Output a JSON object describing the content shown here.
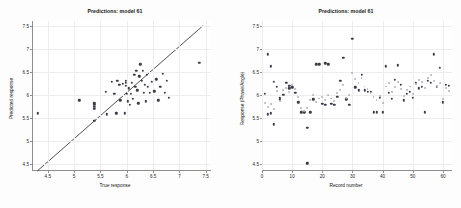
{
  "figure": {
    "background_color": "#fdfdfd",
    "plot_background_color": "#ffffff",
    "grid_color": "#ededed",
    "axis_color": "#8e8e8e",
    "marker_dark_color": "#3c3c46",
    "marker_light_color": "#b2b2bb",
    "identity_line_color": "#3c3c46"
  },
  "panels": {
    "left": {
      "title": "Predictions: model 61",
      "xlabel": "True response",
      "ylabel": "Predicted response",
      "xticks": [
        "4.5",
        "5",
        "5.5",
        "6",
        "6.5",
        "7",
        "7.5"
      ],
      "yticks": [
        "7.5",
        "7",
        "6.5",
        "6",
        "5.5",
        "5",
        "4.5"
      ]
    },
    "right": {
      "title": "Predictions: model 61",
      "xlabel": "Record number",
      "ylabel": "Response (Phase/Angle)",
      "xticks": [
        "0",
        "10",
        "20",
        "30",
        "40",
        "50",
        "60"
      ],
      "yticks": [
        "7.5",
        "7",
        "6.5",
        "6",
        "5.5",
        "5",
        "4.5"
      ]
    }
  },
  "chart_data": [
    {
      "type": "scatter",
      "title": "Predictions: model 61",
      "xlabel": "True response",
      "ylabel": "Predicted response",
      "xlim": [
        4.2,
        7.6
      ],
      "ylim": [
        4.35,
        7.6
      ],
      "grid": true,
      "legend": null,
      "annotations": [
        "identity line y = x drawn from (4.3,4.35) to (7.45,7.5)"
      ],
      "reference_line": {
        "type": "identity",
        "from": [
          4.3,
          4.35
        ],
        "to": [
          7.45,
          7.5
        ]
      },
      "series": [
        {
          "name": "predicted vs true",
          "marker": "dot",
          "color": "#3c3c46",
          "points": [
            [
              4.31,
              5.6
            ],
            [
              5.1,
              5.88
            ],
            [
              5.38,
              5.44
            ],
            [
              5.38,
              5.7
            ],
            [
              5.38,
              5.74
            ],
            [
              5.38,
              5.78
            ],
            [
              5.38,
              5.82
            ],
            [
              5.6,
              6.06
            ],
            [
              5.62,
              5.58
            ],
            [
              5.72,
              6.28
            ],
            [
              5.76,
              6.02
            ],
            [
              5.8,
              5.6
            ],
            [
              5.82,
              6.3
            ],
            [
              5.86,
              6.22
            ],
            [
              5.88,
              5.88
            ],
            [
              5.92,
              6.24
            ],
            [
              5.96,
              5.6
            ],
            [
              5.98,
              6.2
            ],
            [
              5.98,
              6.26
            ],
            [
              5.98,
              6.3
            ],
            [
              6.0,
              6.02
            ],
            [
              6.02,
              5.86
            ],
            [
              6.04,
              6.14
            ],
            [
              6.06,
              5.78
            ],
            [
              6.08,
              6.02
            ],
            [
              6.1,
              6.26
            ],
            [
              6.12,
              5.92
            ],
            [
              6.14,
              6.44
            ],
            [
              6.16,
              6.18
            ],
            [
              6.18,
              6.52
            ],
            [
              6.2,
              6.1
            ],
            [
              6.22,
              5.82
            ],
            [
              6.24,
              6.4
            ],
            [
              6.26,
              6.66
            ],
            [
              6.28,
              6.3
            ],
            [
              6.3,
              6.52
            ],
            [
              6.32,
              6.04
            ],
            [
              6.34,
              6.22
            ],
            [
              6.36,
              5.86
            ],
            [
              6.38,
              6.44
            ],
            [
              6.4,
              6.18
            ],
            [
              6.44,
              6.04
            ],
            [
              6.48,
              6.28
            ],
            [
              6.52,
              6.08
            ],
            [
              6.56,
              6.34
            ],
            [
              6.6,
              5.88
            ],
            [
              6.64,
              6.18
            ],
            [
              6.68,
              6.46
            ],
            [
              6.72,
              6.04
            ],
            [
              6.76,
              6.3
            ],
            [
              6.8,
              5.94
            ],
            [
              7.38,
              6.7
            ]
          ]
        }
      ]
    },
    {
      "type": "scatter",
      "title": "Predictions: model 61",
      "xlabel": "Record number",
      "ylabel": "Response (Phase/Angle)",
      "xlim": [
        0,
        63
      ],
      "ylim": [
        4.35,
        7.6
      ],
      "grid": true,
      "legend": null,
      "series": [
        {
          "name": "observed",
          "marker": "dot",
          "color": "#3c3c46",
          "points": [
            [
              1,
              6.02
            ],
            [
              2,
              5.58
            ],
            [
              2,
              6.88
            ],
            [
              3,
              5.6
            ],
            [
              3,
              6.62
            ],
            [
              4,
              5.36
            ],
            [
              4,
              6.28
            ],
            [
              5,
              6.18
            ],
            [
              6,
              5.9
            ],
            [
              6,
              5.94
            ],
            [
              7,
              6.0
            ],
            [
              8,
              6.26
            ],
            [
              9,
              6.14
            ],
            [
              9,
              6.2
            ],
            [
              10,
              6.16
            ],
            [
              11,
              6.04
            ],
            [
              12,
              5.84
            ],
            [
              13,
              5.62
            ],
            [
              14,
              5.62
            ],
            [
              15,
              4.52
            ],
            [
              15,
              5.28
            ],
            [
              16,
              5.62
            ],
            [
              17,
              5.9
            ],
            [
              18,
              6.66
            ],
            [
              19,
              6.66
            ],
            [
              20,
              5.8
            ],
            [
              21,
              6.68
            ],
            [
              21,
              5.78
            ],
            [
              22,
              6.66
            ],
            [
              23,
              5.8
            ],
            [
              24,
              5.78
            ],
            [
              25,
              5.96
            ],
            [
              26,
              6.3
            ],
            [
              27,
              6.8
            ],
            [
              28,
              5.9
            ],
            [
              29,
              5.78
            ],
            [
              30,
              7.22
            ],
            [
              31,
              6.16
            ],
            [
              32,
              6.1
            ],
            [
              33,
              6.44
            ],
            [
              34,
              6.1
            ],
            [
              35,
              6.06
            ],
            [
              36,
              6.06
            ],
            [
              37,
              5.62
            ],
            [
              38,
              5.62
            ],
            [
              39,
              5.94
            ],
            [
              40,
              5.62
            ],
            [
              41,
              6.62
            ],
            [
              42,
              6.04
            ],
            [
              43,
              5.92
            ],
            [
              44,
              6.32
            ],
            [
              45,
              6.64
            ],
            [
              46,
              6.22
            ],
            [
              47,
              5.88
            ],
            [
              48,
              6.02
            ],
            [
              49,
              6.06
            ],
            [
              50,
              5.94
            ],
            [
              51,
              6.26
            ],
            [
              52,
              6.14
            ],
            [
              53,
              6.18
            ],
            [
              54,
              5.62
            ],
            [
              55,
              6.3
            ],
            [
              56,
              6.26
            ],
            [
              57,
              6.88
            ],
            [
              58,
              6.18
            ],
            [
              59,
              6.58
            ],
            [
              60,
              5.84
            ],
            [
              61,
              6.22
            ],
            [
              62,
              6.2
            ]
          ]
        },
        {
          "name": "predicted",
          "marker": "dot",
          "color": "#b2b2bb",
          "points": [
            [
              1,
              5.82
            ],
            [
              2,
              5.74
            ],
            [
              3,
              5.8
            ],
            [
              4,
              5.7
            ],
            [
              5,
              6.08
            ],
            [
              6,
              5.86
            ],
            [
              7,
              6.1
            ],
            [
              8,
              6.14
            ],
            [
              9,
              6.06
            ],
            [
              10,
              6.22
            ],
            [
              11,
              6.12
            ],
            [
              12,
              5.96
            ],
            [
              13,
              5.72
            ],
            [
              14,
              5.64
            ],
            [
              15,
              5.72
            ],
            [
              16,
              5.88
            ],
            [
              17,
              6.0
            ],
            [
              18,
              5.84
            ],
            [
              19,
              5.92
            ],
            [
              20,
              5.96
            ],
            [
              21,
              5.88
            ],
            [
              22,
              6.0
            ],
            [
              23,
              5.92
            ],
            [
              24,
              5.86
            ],
            [
              25,
              6.04
            ],
            [
              26,
              6.1
            ],
            [
              27,
              6.22
            ],
            [
              28,
              5.94
            ],
            [
              29,
              6.0
            ],
            [
              30,
              6.48
            ],
            [
              31,
              6.34
            ],
            [
              32,
              6.26
            ],
            [
              33,
              6.36
            ],
            [
              34,
              6.18
            ],
            [
              35,
              6.12
            ],
            [
              36,
              6.04
            ],
            [
              37,
              5.96
            ],
            [
              38,
              5.88
            ],
            [
              39,
              5.98
            ],
            [
              40,
              5.82
            ],
            [
              41,
              6.18
            ],
            [
              42,
              6.26
            ],
            [
              43,
              6.06
            ],
            [
              44,
              6.16
            ],
            [
              45,
              6.28
            ],
            [
              46,
              6.12
            ],
            [
              47,
              5.98
            ],
            [
              48,
              6.1
            ],
            [
              49,
              6.18
            ],
            [
              50,
              6.02
            ],
            [
              51,
              6.24
            ],
            [
              52,
              6.32
            ],
            [
              53,
              6.28
            ],
            [
              54,
              6.14
            ],
            [
              55,
              6.36
            ],
            [
              56,
              6.42
            ],
            [
              57,
              6.3
            ],
            [
              58,
              6.2
            ],
            [
              59,
              6.26
            ],
            [
              60,
              5.9
            ],
            [
              61,
              6.14
            ],
            [
              62,
              6.08
            ]
          ]
        }
      ]
    }
  ]
}
